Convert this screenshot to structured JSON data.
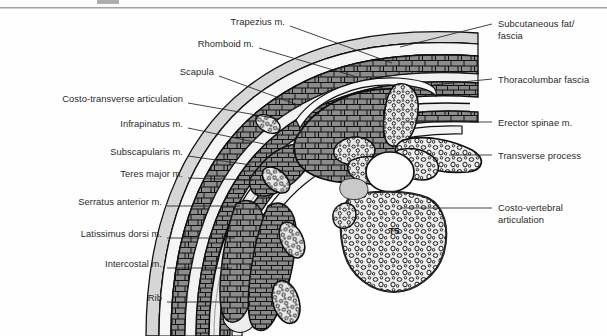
{
  "figure": {
    "title_rule": "horizontal-rule",
    "background_color": "#fefefe",
    "vertebra_label": "T5"
  },
  "labels_left": [
    {
      "id": "trapezius",
      "text": "Trapezius m.",
      "x": 173,
      "y": 22,
      "width": 112,
      "anchor_x": 290,
      "anchor_y": 26,
      "tip_x": 392,
      "tip_y": 63
    },
    {
      "id": "rhomboid",
      "text": "Rhomboid m.",
      "x": 142,
      "y": 44,
      "width": 112,
      "anchor_x": 259,
      "anchor_y": 48,
      "tip_x": 357,
      "tip_y": 77
    },
    {
      "id": "scapula",
      "text": "Scapula",
      "x": 135,
      "y": 72,
      "width": 79,
      "anchor_x": 219,
      "anchor_y": 76,
      "tip_x": 301,
      "tip_y": 106
    },
    {
      "id": "costo-transverse",
      "text": "Costo-transverse articulation",
      "x": 22,
      "y": 99,
      "width": 161,
      "anchor_x": 188,
      "anchor_y": 103,
      "tip_x": 279,
      "tip_y": 119
    },
    {
      "id": "infrapinatus",
      "text": "Infrapinatus m.",
      "x": 58,
      "y": 124,
      "width": 125,
      "anchor_x": 188,
      "anchor_y": 128,
      "tip_x": 264,
      "tip_y": 144
    },
    {
      "id": "subscapularis",
      "text": "Subscapularis m.",
      "x": 48,
      "y": 152,
      "width": 135,
      "anchor_x": 188,
      "anchor_y": 156,
      "tip_x": 251,
      "tip_y": 165
    },
    {
      "id": "teres-major",
      "text": "Teres major m.",
      "x": 59,
      "y": 174,
      "width": 124,
      "anchor_x": 188,
      "anchor_y": 178,
      "tip_x": 253,
      "tip_y": 180
    },
    {
      "id": "serratus-anterior",
      "text": "Serratus anterior m.",
      "x": 14,
      "y": 202,
      "width": 148,
      "anchor_x": 167,
      "anchor_y": 206,
      "tip_x": 240,
      "tip_y": 206
    },
    {
      "id": "latissimus-dorsi",
      "text": "Latissimus dorsi m.",
      "x": 19,
      "y": 234,
      "width": 143,
      "anchor_x": 167,
      "anchor_y": 238,
      "tip_x": 235,
      "tip_y": 238
    },
    {
      "id": "intercostal",
      "text": "Intercostal m.",
      "x": 44,
      "y": 264,
      "width": 118,
      "anchor_x": 167,
      "anchor_y": 268,
      "tip_x": 232,
      "tip_y": 268
    },
    {
      "id": "rib",
      "text": "Rib",
      "x": 89,
      "y": 298,
      "width": 73,
      "anchor_x": 167,
      "anchor_y": 302,
      "tip_x": 237,
      "tip_y": 302
    }
  ],
  "labels_right": [
    {
      "id": "subcutaneous-fat",
      "text": "Subcutaneous fat/\nfascia",
      "x": 498,
      "y": 18,
      "anchor_x": 492,
      "anchor_y": 24,
      "tip_x": 400,
      "tip_y": 47
    },
    {
      "id": "thoracolumbar",
      "text": "Thoracolumbar fascia",
      "x": 498,
      "y": 74,
      "anchor_x": 492,
      "anchor_y": 79,
      "tip_x": 433,
      "tip_y": 85
    },
    {
      "id": "erector-spinae",
      "text": "Erector spinae m.",
      "x": 498,
      "y": 117,
      "anchor_x": 492,
      "anchor_y": 122,
      "tip_x": 404,
      "tip_y": 122
    },
    {
      "id": "transverse-process",
      "text": "Transverse process",
      "x": 498,
      "y": 150,
      "anchor_x": 492,
      "anchor_y": 155,
      "tip_x": 449,
      "tip_y": 155
    },
    {
      "id": "costo-vertebral",
      "text": "Costo-vertebral\narticulation",
      "x": 498,
      "y": 203,
      "anchor_x": 492,
      "anchor_y": 208,
      "tip_x": 400,
      "tip_y": 208
    }
  ],
  "colors": {
    "muscle_fill": "#8c8c8c",
    "muscle_dark": "#7a7a7a",
    "fat_fill": "#d2d2d2",
    "bone_fill": "#ededed",
    "outline": "#0f0f0f",
    "canal_fill": "#fbfbfb",
    "label_text": "#2b2b2b",
    "leader_line": "#222222",
    "rule": "#9b9b9b"
  }
}
